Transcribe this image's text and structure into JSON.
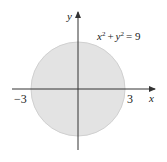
{
  "diagram": {
    "type": "circle-region",
    "equation": {
      "x": "x",
      "exp1": "2",
      "plus": "+",
      "y": "y",
      "exp2": "2",
      "equals": "= 9"
    },
    "axes": {
      "x_label": "x",
      "y_label": "y"
    },
    "ticks": {
      "neg": "−3",
      "pos": "3"
    },
    "colors": {
      "fill": "#e3e3e3",
      "stroke": "#cfcfcf",
      "axis": "#333333"
    }
  }
}
